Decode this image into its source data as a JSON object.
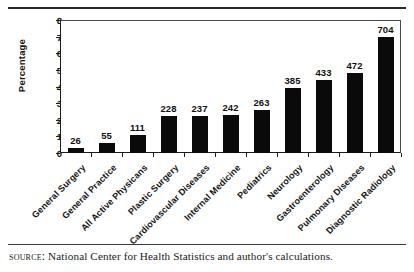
{
  "chart_data": {
    "type": "bar",
    "title": "",
    "subtitle": "",
    "xlabel": "",
    "ylabel": "Percentage",
    "ylim": [
      0,
      8
    ],
    "yticks": [
      "0",
      "1",
      "2",
      "3",
      "4",
      "5",
      "6",
      "7",
      "8"
    ],
    "grid": false,
    "legend": "none",
    "categories": [
      "General Surgery",
      "General Practice",
      "All Active Physicans",
      "Plastic Surgery",
      "Cardiovascular Diseases",
      "Internal Medicine",
      "Pediatrics",
      "Neurology",
      "Gastroenterology",
      "Pulmonary Diseases",
      "Diagnostic Radiology"
    ],
    "values": [
      0.3,
      0.6,
      1.1,
      2.2,
      2.25,
      2.3,
      2.6,
      3.9,
      4.4,
      4.8,
      7.0
    ],
    "point_labels": [
      "26",
      "55",
      "111",
      "228",
      "237",
      "242",
      "263",
      "385",
      "433",
      "472",
      "704"
    ],
    "bar_color": "#0a0a0a"
  },
  "source": {
    "label": "Source:",
    "text": "National Center for Health Statistics and author's calculations."
  }
}
